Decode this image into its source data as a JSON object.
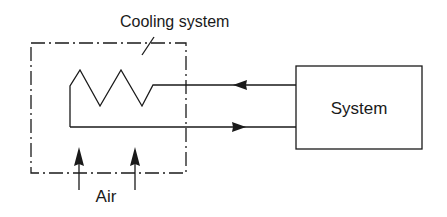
{
  "diagram": {
    "type": "block-diagram",
    "labels": {
      "cooling_system": "Cooling system",
      "system": "System",
      "air": "Air"
    },
    "colors": {
      "stroke": "#1a1a1a",
      "background": "#ffffff"
    },
    "nodes": [
      {
        "id": "cooling-system",
        "label": "Cooling system",
        "shape": "dash-dot boundary",
        "contains": "heat exchanger coil (zigzag)"
      },
      {
        "id": "system",
        "label": "System",
        "shape": "rectangle"
      }
    ],
    "edges": [
      {
        "from": "system",
        "to": "cooling-system",
        "kind": "flow",
        "position": "upper line"
      },
      {
        "from": "cooling-system",
        "to": "system",
        "kind": "flow",
        "position": "lower line"
      },
      {
        "from": "air",
        "to": "cooling-system",
        "kind": "air flow",
        "count": 2,
        "direction": "upward"
      }
    ]
  }
}
